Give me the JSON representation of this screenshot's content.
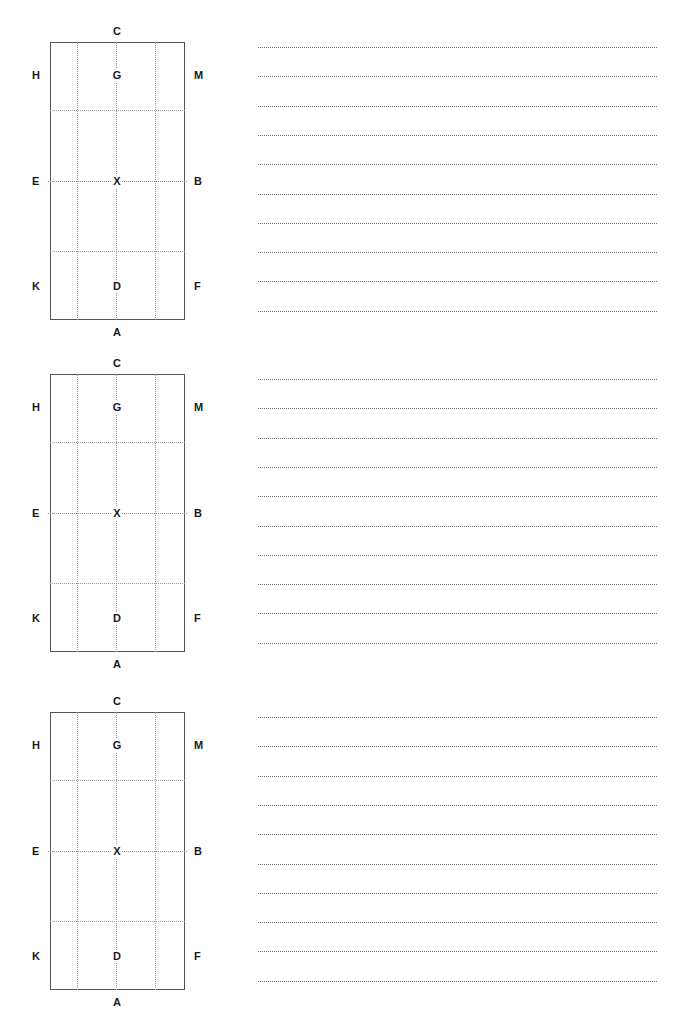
{
  "document": {
    "title": "Labeled Grid Worksheet",
    "background_color": "#ffffff",
    "width": 691,
    "height": 1026,
    "block_count": 3
  },
  "diagram": {
    "name": "labeled-rectangle-grid",
    "frame_color": "#555555",
    "guide_color": "#9a9a9a",
    "label_color": "#1a1a1a",
    "grid": {
      "vertical_guides": 3,
      "horizontal_guides": 3,
      "columns": 4,
      "rows": 4
    },
    "labels": {
      "top": "C",
      "bottom": "A",
      "left_top": "H",
      "left_middle": "E",
      "left_bottom": "K",
      "right_top": "M",
      "right_middle": "B",
      "right_bottom": "F",
      "inner_top": "G",
      "inner_middle": "X",
      "inner_bottom": "D"
    }
  },
  "notes": {
    "name": "dotted-ruled-lines",
    "line_color": "#6e6e6e",
    "lines_per_block": 10,
    "line_spacing_px": 29.3,
    "content": [
      "",
      "",
      "",
      "",
      "",
      "",
      "",
      "",
      "",
      ""
    ]
  },
  "blocks": [
    {
      "id": "block-1",
      "index": 1,
      "top": 25,
      "diagram": {
        "labels": {
          "top": "C",
          "bottom": "A",
          "left_top": "H",
          "left_middle": "E",
          "left_bottom": "K",
          "right_top": "M",
          "right_middle": "B",
          "right_bottom": "F",
          "inner_top": "G",
          "inner_middle": "X",
          "inner_bottom": "D"
        }
      }
    },
    {
      "id": "block-2",
      "index": 2,
      "top": 357,
      "diagram": {
        "labels": {
          "top": "C",
          "bottom": "A",
          "left_top": "H",
          "left_middle": "E",
          "left_bottom": "K",
          "right_top": "M",
          "right_middle": "B",
          "right_bottom": "F",
          "inner_top": "G",
          "inner_middle": "X",
          "inner_bottom": "D"
        }
      }
    },
    {
      "id": "block-3",
      "index": 3,
      "top": 695,
      "diagram": {
        "labels": {
          "top": "C",
          "bottom": "A",
          "left_top": "H",
          "left_middle": "E",
          "left_bottom": "K",
          "right_top": "M",
          "right_middle": "B",
          "right_bottom": "F",
          "inner_top": "G",
          "inner_middle": "X",
          "inner_bottom": "D"
        }
      }
    }
  ]
}
